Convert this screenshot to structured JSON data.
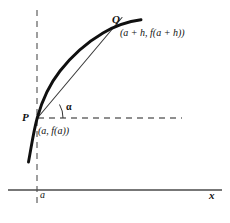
{
  "figure": {
    "labels": {
      "point_p": "P",
      "point_p_coord": "(a, f(a))",
      "point_q": "Q",
      "point_q_coord": "(a + h, f(a + h))",
      "angle": "α",
      "x_tick": "a",
      "x_axis": "x"
    },
    "colors": {
      "curve": "#101010",
      "secant": "#3a3a3a",
      "axis": "#4a4a4a",
      "dashed": "#6b6b6b",
      "text": "#111111",
      "background": "#ffffff"
    },
    "geometry": {
      "x_axis_y": 190,
      "x_axis_x_start": 8,
      "x_axis_x_end": 222,
      "vertical_dashed_x": 37,
      "vertical_dashed_y_start": 10,
      "vertical_dashed_y_end": 208,
      "horizontal_dashed_y": 118,
      "horizontal_dashed_x_start": 38,
      "horizontal_dashed_x_end": 182,
      "point_p": [
        37,
        118
      ],
      "point_q": [
        113,
        28
      ],
      "curve_start": [
        28,
        162
      ],
      "curve_end": [
        141,
        20
      ],
      "angle_degrees": 31
    }
  }
}
